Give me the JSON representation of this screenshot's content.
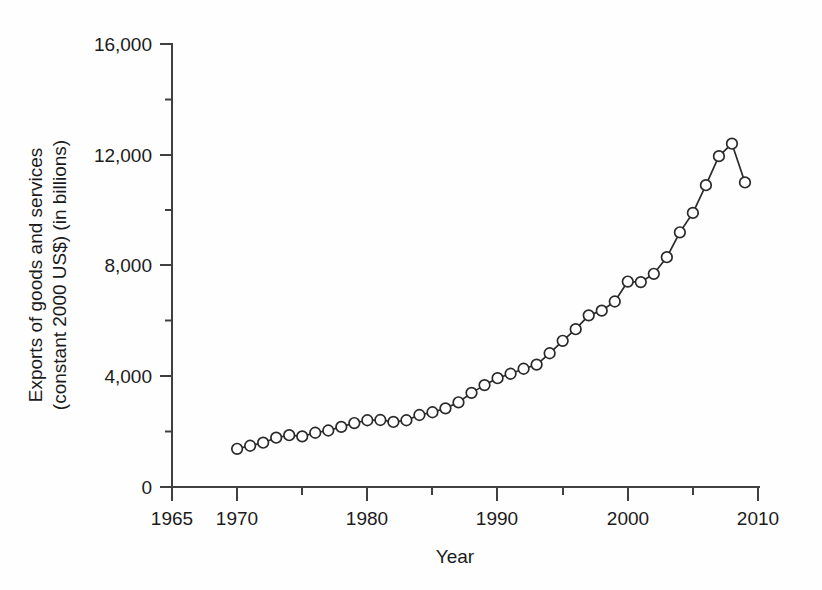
{
  "chart_data": {
    "type": "line",
    "title": "",
    "xlabel": "Year",
    "ylabel": "Exports of goods and services (constant 2000 US$) (in billions)",
    "ylabel_line1": "Exports of goods and services",
    "ylabel_line2": "(constant 2000 US$) (in billions)",
    "xlim": [
      1965,
      2010
    ],
    "ylim": [
      0,
      16000
    ],
    "x_major_ticks": [
      1965,
      1970,
      1980,
      1990,
      2000,
      2010
    ],
    "x_major_tick_labels": [
      "1965",
      "1970",
      "1980",
      "1990",
      "2000",
      "2010"
    ],
    "x_minor_ticks": [
      1975,
      1985,
      1995,
      2005
    ],
    "y_major_ticks": [
      0,
      4000,
      8000,
      12000,
      16000
    ],
    "y_major_tick_labels": [
      "0",
      "4,000",
      "8,000",
      "12,000",
      "16,000"
    ],
    "y_minor_ticks": [
      2000,
      6000,
      10000,
      14000
    ],
    "grid": false,
    "legend": null,
    "marker": "open-circle",
    "line_color": "#2a2a2a",
    "marker_fill": "#ffffff",
    "x": [
      1970,
      1971,
      1972,
      1973,
      1974,
      1975,
      1976,
      1977,
      1978,
      1979,
      1980,
      1981,
      1982,
      1983,
      1984,
      1985,
      1986,
      1987,
      1988,
      1989,
      1990,
      1991,
      1992,
      1993,
      1994,
      1995,
      1996,
      1997,
      1998,
      1999,
      2000,
      2001,
      2002,
      2003,
      2004,
      2005,
      2006,
      2007,
      2008,
      2009
    ],
    "values": [
      1380,
      1490,
      1600,
      1780,
      1870,
      1830,
      1960,
      2040,
      2170,
      2310,
      2410,
      2420,
      2350,
      2410,
      2600,
      2700,
      2840,
      3060,
      3400,
      3680,
      3930,
      4090,
      4270,
      4420,
      4830,
      5280,
      5700,
      6200,
      6370,
      6700,
      7420,
      7400,
      7700,
      8300,
      9200,
      9900,
      10900,
      11950,
      12400,
      11000
    ]
  }
}
